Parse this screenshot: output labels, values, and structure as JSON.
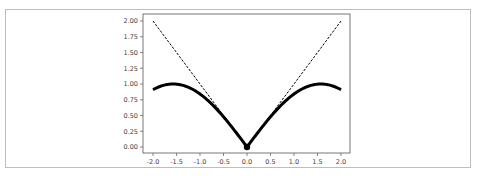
{
  "chart_data": {
    "type": "line",
    "title": "",
    "xlabel": "",
    "ylabel": "",
    "xlim": [
      -2.2,
      2.2
    ],
    "ylim": [
      -0.1,
      2.1
    ],
    "grid": false,
    "legend": null,
    "x_ticks": [
      "-2.0",
      "-1.5",
      "-1.0",
      "-0.5",
      "0.0",
      "0.5",
      "1.0",
      "1.5",
      "2.0"
    ],
    "y_ticks": [
      "0.00",
      "0.25",
      "0.50",
      "0.75",
      "1.00",
      "1.25",
      "1.50",
      "1.75",
      "2.00"
    ],
    "series": [
      {
        "name": "abs(sin(x))",
        "style": "solid-thick",
        "color": "#000000",
        "x": [
          -2.0,
          -1.75,
          -1.5708,
          -1.5,
          -1.25,
          -1.0,
          -0.75,
          -0.5,
          -0.25,
          0.0,
          0.25,
          0.5,
          0.75,
          1.0,
          1.25,
          1.5,
          1.5708,
          1.75,
          2.0
        ],
        "y": [
          0.909,
          0.984,
          1.0,
          0.997,
          0.949,
          0.841,
          0.682,
          0.479,
          0.247,
          0.0,
          0.247,
          0.479,
          0.682,
          0.841,
          0.949,
          0.997,
          1.0,
          0.984,
          0.909
        ]
      },
      {
        "name": "abs(x)",
        "style": "dashed",
        "color": "#000000",
        "x": [
          -2.0,
          0.0,
          2.0
        ],
        "y": [
          2.0,
          0.0,
          2.0
        ]
      },
      {
        "name": "origin-point",
        "style": "marker",
        "color": "#000000",
        "x": [
          0.0
        ],
        "y": [
          0.0
        ]
      }
    ]
  }
}
